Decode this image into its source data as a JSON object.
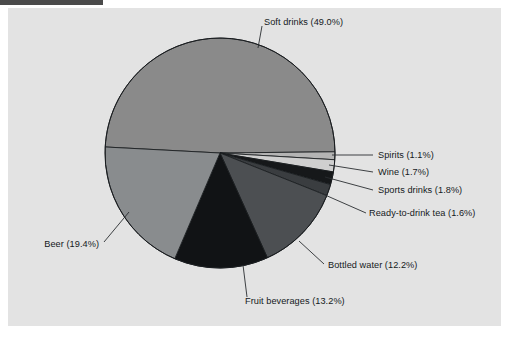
{
  "figure": {
    "background_color": "#e3e3e3",
    "page_color": "#ffffff",
    "artifact_color": "#4a4a4a"
  },
  "chart_data": {
    "type": "pie",
    "title": "",
    "subtitle": "",
    "xlabel": "",
    "ylabel": "",
    "legend_position": "none",
    "grid": false,
    "labels_outside": true,
    "units": "percent",
    "categories": [
      "Soft drinks",
      "Spirits",
      "Wine",
      "Sports drinks",
      "Ready-to-drink tea",
      "Bottled water",
      "Fruit beverages",
      "Beer"
    ],
    "values": [
      49.0,
      1.1,
      1.7,
      1.8,
      1.6,
      12.2,
      13.2,
      19.4
    ],
    "slice_labels": [
      "Soft drinks (49.0%)",
      "Spirits (1.1%)",
      "Wine (1.7%)",
      "Sports drinks (1.8%)",
      "Ready-to-drink tea (1.6%)",
      "Bottled water (12.2%)",
      "Fruit beverages (13.2%)",
      "Beer (19.4%)"
    ],
    "slice_colors": [
      "#8a8a8a",
      "#b4b4b4",
      "#cfcfcf",
      "#16181a",
      "#3a3d40",
      "#4c4f52",
      "#111315",
      "#898c8e"
    ],
    "start_angle_deg": 183,
    "direction": "clockwise",
    "total": 100.0
  },
  "labels": {
    "soft_drinks": "Soft drinks (49.0%)",
    "spirits": "Spirits (1.1%)",
    "wine": "Wine (1.7%)",
    "sports_drinks": "Sports drinks (1.8%)",
    "rtd_tea": "Ready-to-drink tea (1.6%)",
    "bottled_water": "Bottled water (12.2%)",
    "fruit_beverages": "Fruit beverages (13.2%)",
    "beer": "Beer (19.4%)"
  }
}
